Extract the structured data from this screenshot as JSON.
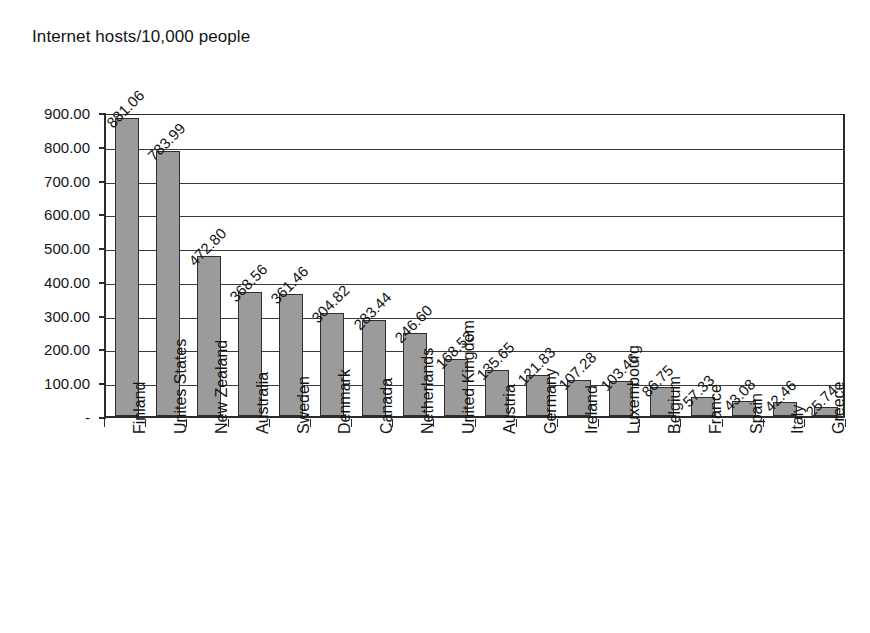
{
  "chart_data": {
    "type": "bar",
    "title": "Internet hosts/10,000 people",
    "xlabel": "",
    "ylabel": "",
    "ylim": [
      0,
      900
    ],
    "ytick_values": [
      0,
      100,
      200,
      300,
      400,
      500,
      600,
      700,
      800,
      900
    ],
    "ytick_labels": [
      "-",
      "100.00",
      "200.00",
      "300.00",
      "400.00",
      "500.00",
      "600.00",
      "700.00",
      "800.00",
      "900.00"
    ],
    "grid": true,
    "legend": null,
    "legend_position": "none",
    "orientation": "vertical",
    "bar_color": "#9b9b9b",
    "bar_border_color": "#2e2e2e",
    "value_label_rotation": 45,
    "category_label_rotation": 90,
    "categories": [
      "Finland",
      "Unites States",
      "New Zealand",
      "Australia",
      "Sweden",
      "Denmark",
      "Canada",
      "Netherlands",
      "United Kingdom",
      "Austria",
      "Germany",
      "Ireland",
      "Luxembourg",
      "Belgium",
      "France",
      "Spain",
      "Italy",
      "Greece"
    ],
    "values": [
      881.06,
      783.99,
      472.8,
      368.56,
      361.46,
      304.82,
      283.44,
      246.6,
      168.52,
      135.65,
      121.83,
      107.28,
      103.46,
      86.75,
      57.33,
      43.08,
      42.46,
      25.74
    ],
    "value_labels": [
      "881.06",
      "783.99",
      "472.80",
      "368.56",
      "361.46",
      "304.82",
      "283.44",
      "246.60",
      "168.52",
      "135.65",
      "121.83",
      "107.28",
      "103.46",
      "86.75",
      "57.33",
      "43.08",
      "42.46",
      "25.74"
    ]
  }
}
